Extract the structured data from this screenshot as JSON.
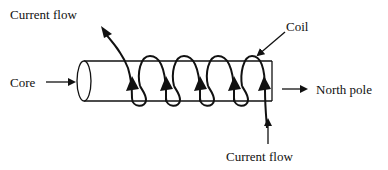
{
  "diagram": {
    "labels": {
      "current_flow_top": "Current flow",
      "core": "Core",
      "coil": "Coil",
      "north_pole": "North pole",
      "current_flow_bottom": "Current flow"
    },
    "coil_turns": 5,
    "colors": {
      "stroke": "#111111",
      "background": "#ffffff"
    }
  }
}
